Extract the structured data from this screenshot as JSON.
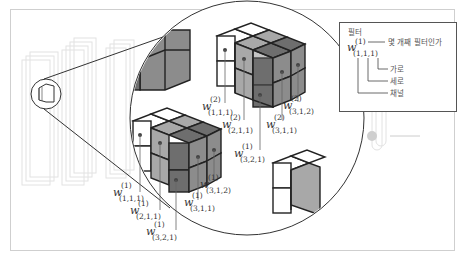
{
  "legend": {
    "title": "필터",
    "symbol": "w",
    "superscript": "(1)",
    "subscript": "(1,1,1)",
    "annotations": [
      {
        "key": "superscript",
        "text": "몇 개째 필터인가"
      },
      {
        "key": "index3",
        "text": "가로"
      },
      {
        "key": "index2",
        "text": "세로"
      },
      {
        "key": "index1",
        "text": "채널"
      }
    ]
  },
  "top_cube_labels": [
    {
      "sup": "(2)",
      "sub": "(1,1,1)"
    },
    {
      "sup": "(2)",
      "sub": "(2,1,1)"
    },
    {
      "sup": "(1)",
      "sub": "(3,2,1)"
    },
    {
      "sup": "(2)",
      "sub": "(3,1,1)"
    },
    {
      "sup": "(2)",
      "sub": "(3,1,2)"
    }
  ],
  "bottom_cube_labels": [
    {
      "sup": "(1)",
      "sub": "(1,1,1)"
    },
    {
      "sup": "(1)",
      "sub": "(2,1,1)"
    },
    {
      "sup": "(1)",
      "sub": "(3,2,1)"
    },
    {
      "sup": "(1)",
      "sub": "(3,1,1)"
    },
    {
      "sup": "(1)",
      "sub": "(3,1,2)"
    }
  ],
  "colors": {
    "white_face": "#ffffff",
    "light_gray": "#a8a8a8",
    "mid_gray": "#8c8c8c",
    "dark_gray": "#6e6e6e",
    "edge": "#222222"
  }
}
